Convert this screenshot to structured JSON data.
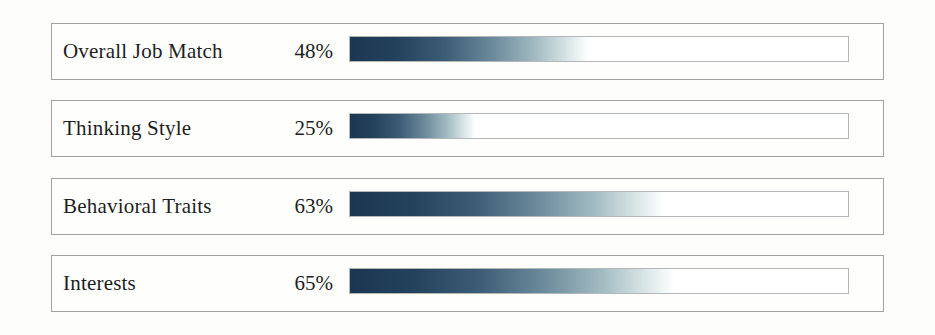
{
  "chart_data": {
    "type": "bar",
    "orientation": "horizontal",
    "categories": [
      "Overall Job Match",
      "Thinking Style",
      "Behavioral Traits",
      "Interests"
    ],
    "values": [
      48,
      25,
      63,
      65
    ],
    "value_labels": [
      "48%",
      "25%",
      "63%",
      "65%"
    ],
    "value_range": [
      0,
      100
    ],
    "grid": false,
    "legend": false,
    "colors": {
      "bar_gradient_stops": [
        "#1c3650 0%",
        "#24425c 20%",
        "#3d5d76 40%",
        "#6d8b9c 60%",
        "#a3bcc3 78%",
        "#d5e2e3 90%",
        "#ffffff 100%"
      ],
      "track_fill": "#ffffff",
      "track_border": "#b3b7b7",
      "row_border": "#a2a2a2",
      "text": "#1e1e1e",
      "background": "#fdfdfc"
    }
  }
}
